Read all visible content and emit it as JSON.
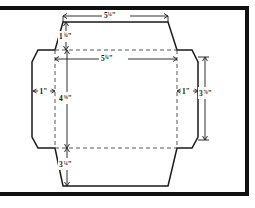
{
  "figure": {
    "type": "technical-drawing",
    "units": "inches",
    "frame_color": "#111111",
    "cut_line_color": "#1a1a1a",
    "fold_line_color": "#555555"
  },
  "dimensions": {
    "top_flap_width": {
      "whole": "5",
      "fraction": "¼",
      "unit": "\"",
      "full": "5¼\""
    },
    "top_flap_height": {
      "whole": "1",
      "fraction": "¾",
      "unit": "\"",
      "full": "1¾\""
    },
    "body_width": {
      "whole": "5",
      "fraction": "¾",
      "unit": "\"",
      "full": "5¾\""
    },
    "body_height": {
      "whole": "4",
      "fraction": "⅜",
      "unit": "\"",
      "full": "4⅜\""
    },
    "side_flap_width_left": {
      "whole": "1",
      "fraction": "",
      "unit": "\"",
      "full": "1\""
    },
    "side_flap_width_right": {
      "whole": "1",
      "fraction": "",
      "unit": "\"",
      "full": "1\""
    },
    "overall_height_right": {
      "whole": "3",
      "fraction": "⅞",
      "unit": "\"",
      "full": "3⅞\""
    },
    "bottom_flap_height": {
      "whole": "3",
      "fraction": "¼",
      "unit": "\"",
      "full": "3¼\""
    }
  },
  "labels": {
    "top": "5¼\"",
    "top_flap": "1¾\"",
    "inner_top": "5¾\"",
    "left_side": "1\"",
    "right_side": "1\"",
    "center_left": "4⅜\"",
    "right_outer": "3⅞\"",
    "bottom": "3¼\""
  },
  "label_parts": {
    "top": {
      "whole": "5",
      "frac": "¼",
      "unit": "\""
    },
    "top_flap": {
      "whole": "1",
      "frac": "¾",
      "unit": "\""
    },
    "inner_top": {
      "whole": "5",
      "frac": "¾",
      "unit": "\""
    },
    "left_side": {
      "whole": "1",
      "frac": "",
      "unit": "\""
    },
    "right_side": {
      "whole": "1",
      "frac": "",
      "unit": "\""
    },
    "center_left": {
      "whole": "4",
      "frac": "⅜",
      "unit": "\""
    },
    "right_outer": {
      "whole": "3",
      "frac": "⅞",
      "unit": "\""
    },
    "bottom": {
      "whole": "3",
      "frac": "¼",
      "unit": "\""
    }
  }
}
